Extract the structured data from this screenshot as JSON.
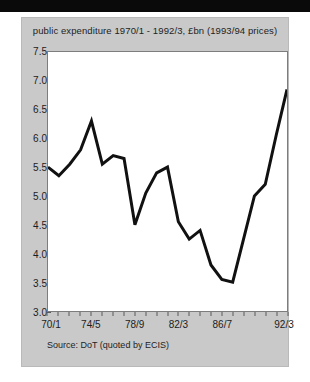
{
  "page": {
    "background_color": "#c9c9c9",
    "plot_background_color": "#ffffff",
    "top_bar_color": "#0a0a0a"
  },
  "source_note": "Source: DoT (quoted by ECIS)",
  "chart_data": {
    "type": "line",
    "title": "public expenditure 1970/1 - 1992/3, £bn (1993/94 prices)",
    "xlabel": "",
    "ylabel": "",
    "line_color": "#111111",
    "line_width": 3,
    "grid": false,
    "legend": false,
    "ylim": [
      3.0,
      7.5
    ],
    "yticks": [
      3.0,
      3.5,
      4.0,
      4.5,
      5.0,
      5.5,
      6.0,
      6.5,
      7.0,
      7.5
    ],
    "ytick_labels": [
      "3.0",
      "3.5",
      "4.0",
      "4.5",
      "5.0",
      "5.5",
      "6.0",
      "6.5",
      "7.0",
      "7.5"
    ],
    "categories": [
      "70/1",
      "71/2",
      "72/3",
      "73/4",
      "74/5",
      "75/6",
      "76/7",
      "77/8",
      "78/9",
      "79/80",
      "80/1",
      "81/2",
      "82/3",
      "83/4",
      "84/5",
      "85/6",
      "86/7",
      "87/8",
      "88/9",
      "89/90",
      "90/1",
      "91/2",
      "92/3"
    ],
    "xtick_labels": [
      "70/1",
      "74/5",
      "78/9",
      "82/3",
      "86/7",
      "92/3"
    ],
    "xtick_indices": [
      0,
      4,
      8,
      12,
      16,
      22
    ],
    "values": [
      5.5,
      5.35,
      5.55,
      5.8,
      6.3,
      5.55,
      5.7,
      5.65,
      4.5,
      5.05,
      5.4,
      5.5,
      4.55,
      4.25,
      4.4,
      3.8,
      3.55,
      3.5,
      4.25,
      5.0,
      5.2,
      6.05,
      6.85
    ]
  }
}
